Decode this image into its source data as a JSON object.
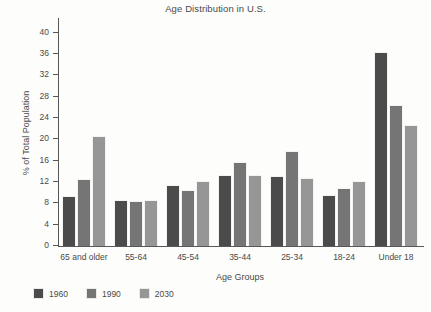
{
  "chart_data": {
    "type": "bar",
    "title": "Age Distribution in U.S.",
    "xlabel": "Age Groups",
    "ylabel": "% of Total Population",
    "ylim": [
      0,
      42
    ],
    "yticks": [
      0,
      4,
      8,
      12,
      16,
      20,
      24,
      28,
      32,
      36,
      40
    ],
    "grid": false,
    "legend_position": "bottom-left",
    "categories": [
      "65 and older",
      "55-64",
      "45-54",
      "35-44",
      "25-34",
      "18-24",
      "Under 18"
    ],
    "series": [
      {
        "name": "1960",
        "color": "#4b4b4b",
        "values": [
          9.3,
          8.7,
          11.5,
          13.4,
          13.1,
          9.5,
          36.3
        ]
      },
      {
        "name": "1990",
        "color": "#757575",
        "values": [
          12.5,
          8.5,
          10.5,
          15.7,
          17.9,
          10.8,
          26.5
        ]
      },
      {
        "name": "2030",
        "color": "#969696",
        "values": [
          20.7,
          8.6,
          12.2,
          13.3,
          12.8,
          12.1,
          22.7
        ]
      }
    ]
  }
}
